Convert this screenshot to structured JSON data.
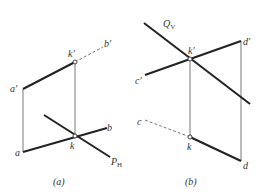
{
  "figure_a": {
    "caption": "(a)",
    "labels": {
      "k_prime": "k′",
      "b_prime": "b′",
      "a_prime": "a′",
      "a": "a",
      "k": "k",
      "b": "b",
      "P": "P",
      "P_sub": "H"
    }
  },
  "figure_b": {
    "caption": "(b)",
    "labels": {
      "Q": "Q",
      "Q_sub": "V",
      "k_prime": "k′",
      "d_prime": "d′",
      "c_prime": "c′",
      "c": "c",
      "k": "k",
      "d": "d"
    }
  }
}
